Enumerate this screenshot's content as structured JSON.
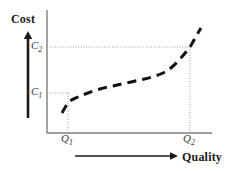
{
  "figure": {
    "name": "cost-vs-quality-curve",
    "background_color": "#ffffff",
    "ink_color": "#1a1a1a",
    "guide_color": "#9a9a9a"
  },
  "axes": {
    "y_title": "Cost",
    "x_title": "Quality",
    "y_axis_x": 47,
    "y_axis_top": 10,
    "y_axis_bottom": 133,
    "x_axis_y": 133,
    "x_axis_left": 47,
    "x_axis_right": 212
  },
  "direction_arrows": {
    "vertical": {
      "name": "increasing-cost-arrow",
      "x": 28,
      "y_tail": 118,
      "y_head": 31
    },
    "horizontal": {
      "name": "increasing-quality-arrow",
      "y": 156,
      "x_tail": 75,
      "x_head": 178
    }
  },
  "tick_labels": {
    "y": [
      {
        "text": "C",
        "sub": "2",
        "value_y": 47
      },
      {
        "text": "C",
        "sub": "1",
        "value_y": 93
      }
    ],
    "x": [
      {
        "text": "Q",
        "sub": "1",
        "value_x": 68
      },
      {
        "text": "Q",
        "sub": "2",
        "value_x": 190
      }
    ]
  },
  "guide_lines": [
    {
      "name": "c2-horizontal-guide",
      "x1": 47,
      "y1": 47,
      "x2": 191,
      "y2": 47
    },
    {
      "name": "c1-horizontal-guide",
      "x1": 47,
      "y1": 93,
      "x2": 69,
      "y2": 93
    },
    {
      "name": "q1-vertical-guide",
      "x1": 68,
      "y1": 93,
      "x2": 68,
      "y2": 133
    },
    {
      "name": "q2-vertical-guide",
      "x1": 190,
      "y1": 47,
      "x2": 190,
      "y2": 133
    }
  ],
  "chart_data": {
    "type": "line",
    "title": "",
    "xlabel": "Quality",
    "ylabel": "Cost",
    "grid": false,
    "legend": null,
    "line_style": "dashed",
    "line_color": "#111111",
    "line_width": 3,
    "annotations": [
      {
        "label": "C1",
        "axis": "y",
        "pixel": 93
      },
      {
        "label": "C2",
        "axis": "y",
        "pixel": 47
      },
      {
        "label": "Q1",
        "axis": "x",
        "pixel": 68
      },
      {
        "label": "Q2",
        "axis": "x",
        "pixel": 190
      }
    ],
    "series": [
      {
        "name": "cost-of-quality",
        "points_px": [
          [
            62,
            113
          ],
          [
            66,
            106
          ],
          [
            70,
            101
          ],
          [
            78,
            97
          ],
          [
            88,
            93
          ],
          [
            100,
            89
          ],
          [
            113,
            86
          ],
          [
            126,
            83
          ],
          [
            140,
            80
          ],
          [
            152,
            77
          ],
          [
            163,
            73
          ],
          [
            172,
            67
          ],
          [
            180,
            59
          ],
          [
            186,
            52
          ],
          [
            190,
            47
          ],
          [
            194,
            40
          ],
          [
            198,
            33
          ],
          [
            201,
            28
          ]
        ]
      }
    ]
  }
}
